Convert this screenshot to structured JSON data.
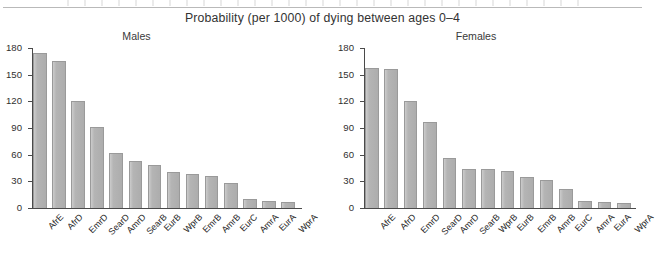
{
  "figure": {
    "main_title": "Probability (per 1000) of dying between ages 0–4"
  },
  "axis": {
    "y_ticks": [
      "180",
      "150",
      "120",
      "90",
      "60",
      "30",
      "0"
    ]
  },
  "chart_data": [
    {
      "type": "bar",
      "title": "Males",
      "xlabel": "",
      "ylabel": "",
      "ylim": [
        0,
        180
      ],
      "yticks": [
        0,
        30,
        60,
        90,
        120,
        150,
        180
      ],
      "grid": false,
      "legend": "none",
      "categories": [
        "AfrE",
        "AfrD",
        "EmrD",
        "SearD",
        "AmrD",
        "SearB",
        "EurB",
        "WprB",
        "EmrB",
        "AmrB",
        "EurC",
        "AmrA",
        "EurA",
        "WprA"
      ],
      "values": [
        174,
        165,
        120,
        91,
        62,
        53,
        48,
        40,
        38,
        36,
        28,
        10,
        8,
        7
      ]
    },
    {
      "type": "bar",
      "title": "Females",
      "xlabel": "",
      "ylabel": "",
      "ylim": [
        0,
        180
      ],
      "yticks": [
        0,
        30,
        60,
        90,
        120,
        150,
        180
      ],
      "grid": false,
      "legend": "none",
      "categories": [
        "AfrE",
        "AfrD",
        "EmrD",
        "SearD",
        "AmrD",
        "SearB",
        "WprB",
        "EurB",
        "EmrB",
        "AmrB",
        "EurC",
        "AmrA",
        "EurA",
        "WprA"
      ],
      "values": [
        158,
        156,
        120,
        97,
        56,
        44,
        44,
        42,
        35,
        31,
        21,
        8,
        7,
        6
      ]
    }
  ],
  "colors": {
    "bar_fill": "#b3b3b3",
    "bar_stroke": "#9a9a9a",
    "axis": "#4a4a4a",
    "text": "#2b2b2b",
    "background": "#ffffff"
  }
}
